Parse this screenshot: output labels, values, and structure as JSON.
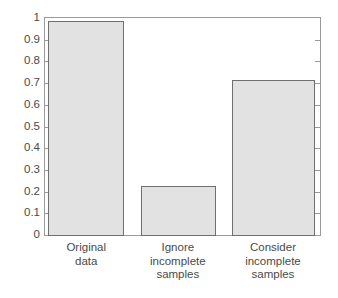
{
  "chart_data": {
    "type": "bar",
    "title": "",
    "subtitle": "",
    "xlabel": "",
    "ylabel": "",
    "categories": [
      "Original\ndata",
      "Ignore\nincomplete\nsamples",
      "Consider\nincomplete\nsamples"
    ],
    "category_labels_flat": [
      "Original data",
      "Ignore incomplete samples",
      "Consider incomplete samples"
    ],
    "values": [
      0.99,
      0.23,
      0.72
    ],
    "ylim": [
      0,
      1
    ],
    "xlim": [
      0,
      3
    ],
    "ytick_values": [
      0,
      0.1,
      0.2,
      0.3,
      0.4,
      0.5,
      0.6,
      0.7,
      0.8,
      0.9,
      1
    ],
    "ytick_labels": [
      "0",
      "0.1",
      "0.2",
      "0.3",
      "0.4",
      "0.5",
      "0.6",
      "0.7",
      "0.8",
      "0.9",
      "1"
    ],
    "grid": false,
    "legend": null,
    "legend_position": "none",
    "bar_fill_color": "#e2e2e2",
    "bar_edge_color": "#6f6f6f",
    "axis_color": "#9a9a9a",
    "text_color": "#4a4a4a",
    "background_color": "#ffffff",
    "tick_direction": "in",
    "frame": "box",
    "bar_geometry": [
      {
        "left_pct": 1.2,
        "width_pct": 27.6
      },
      {
        "left_pct": 34.8,
        "width_pct": 27.0
      },
      {
        "left_pct": 67.8,
        "width_pct": 30.2
      }
    ]
  }
}
